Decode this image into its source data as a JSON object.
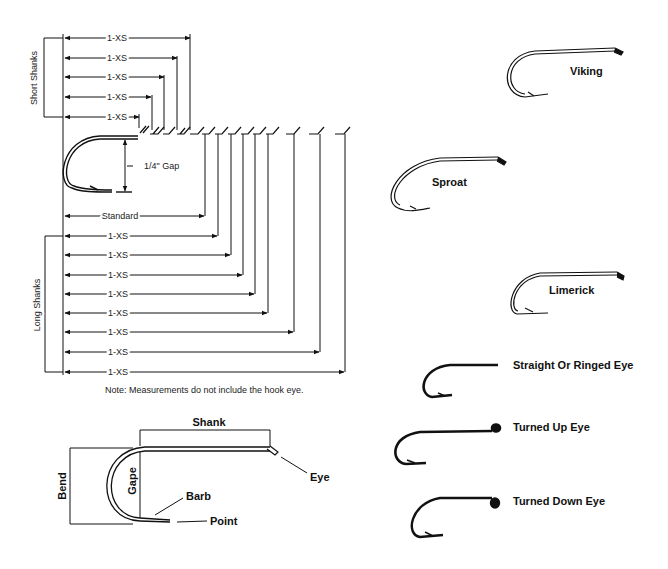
{
  "diagram": {
    "shank_chart": {
      "short_shanks_label": "Short Shanks",
      "long_shanks_label": "Long Shanks",
      "short_rows": [
        "1-XS",
        "1-XS",
        "1-XS",
        "1-XS",
        "1-XS"
      ],
      "standard_label": "Standard",
      "gap_label": "1/4\" Gap",
      "long_rows": [
        "1-XS",
        "1-XS",
        "1-XS",
        "1-XS",
        "1-XS",
        "1-XS",
        "1-XS",
        "1-XS"
      ],
      "note": "Note: Measurements do not include the hook eye."
    },
    "anatomy": {
      "shank": "Shank",
      "bend": "Bend",
      "gape": "Gape",
      "barb": "Barb",
      "point": "Point",
      "eye": "Eye"
    },
    "hook_styles": [
      {
        "name": "Viking"
      },
      {
        "name": "Sproat"
      },
      {
        "name": "Limerick"
      }
    ],
    "eye_styles": [
      {
        "name": "Straight Or Ringed Eye"
      },
      {
        "name": "Turned Up Eye"
      },
      {
        "name": "Turned Down Eye"
      }
    ]
  }
}
